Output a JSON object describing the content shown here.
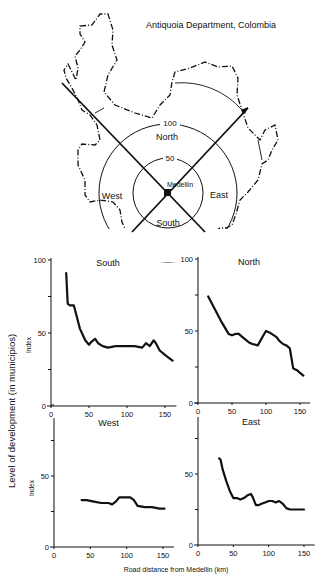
{
  "map": {
    "title": "Antiquoia Department, Colombia",
    "center_label": "Medellin",
    "ring_labels": [
      "50",
      "100"
    ],
    "sector_labels": {
      "north": "North",
      "south": "South",
      "east": "East",
      "west": "West"
    }
  },
  "figure": {
    "ylabel": "Level of development (in municipios)",
    "xlabel": "Road distance from Medellin (km)",
    "panel_ylabel": "Index"
  },
  "chart_data": [
    {
      "type": "line",
      "title": "South",
      "xlabel": "Road distance from Medellin (km)",
      "ylabel": "Index",
      "xlim": [
        0,
        160
      ],
      "ylim": [
        0,
        100
      ],
      "xticks": [
        0,
        50,
        100,
        150
      ],
      "yticks": [
        0,
        50,
        100
      ],
      "x": [
        20,
        22,
        25,
        30,
        33,
        38,
        45,
        50,
        53,
        58,
        62,
        68,
        75,
        85,
        100,
        110,
        120,
        125,
        130,
        135,
        138,
        143,
        150,
        155,
        160
      ],
      "y": [
        91,
        70,
        69,
        69,
        63,
        53,
        45,
        42,
        44,
        46,
        43,
        41,
        40,
        41,
        41,
        41,
        40,
        43,
        41,
        45,
        43,
        38,
        35,
        33,
        31
      ]
    },
    {
      "type": "line",
      "title": "North",
      "xlabel": "Road distance from Medellin (km)",
      "ylabel": "Index",
      "xlim": [
        0,
        160
      ],
      "ylim": [
        0,
        100
      ],
      "xticks": [
        0,
        50,
        100,
        150
      ],
      "yticks": [
        0,
        50,
        100
      ],
      "x": [
        15,
        25,
        35,
        45,
        50,
        55,
        60,
        65,
        70,
        75,
        80,
        88,
        95,
        100,
        105,
        115,
        120,
        125,
        130,
        135,
        140,
        145,
        150,
        155
      ],
      "y": [
        74,
        65,
        56,
        48,
        47,
        48,
        48,
        46,
        44,
        42,
        41,
        40,
        46,
        50,
        49,
        46,
        43,
        41,
        40,
        38,
        24,
        23,
        21,
        19
      ]
    },
    {
      "type": "line",
      "title": "West",
      "xlabel": "Road distance from Medellin (km)",
      "ylabel": "Index",
      "xlim": [
        0,
        160
      ],
      "ylim": [
        0,
        100
      ],
      "xticks": [
        0,
        50,
        100,
        150
      ],
      "yticks": [
        0,
        50,
        100
      ],
      "x": [
        38,
        45,
        55,
        65,
        75,
        80,
        85,
        90,
        95,
        100,
        105,
        110,
        115,
        125,
        135,
        145,
        152
      ],
      "y": [
        33,
        33,
        32,
        31,
        31,
        30,
        32,
        35,
        35,
        35,
        35,
        33,
        29,
        28,
        28,
        27,
        27
      ]
    },
    {
      "type": "line",
      "title": "East",
      "xlabel": "Road distance from Medellin (km)",
      "ylabel": "Index",
      "xlim": [
        0,
        160
      ],
      "ylim": [
        0,
        100
      ],
      "xticks": [
        0,
        50,
        100,
        150
      ],
      "yticks": [
        0,
        50,
        100
      ],
      "x": [
        30,
        32,
        35,
        40,
        45,
        50,
        55,
        60,
        65,
        70,
        75,
        78,
        82,
        85,
        90,
        95,
        100,
        105,
        110,
        115,
        120,
        125,
        130,
        140,
        150
      ],
      "y": [
        61,
        60,
        53,
        45,
        38,
        33,
        33,
        32,
        33,
        35,
        36,
        33,
        28,
        28,
        29,
        30,
        31,
        31,
        30,
        31,
        29,
        26,
        25,
        25,
        25
      ]
    }
  ]
}
